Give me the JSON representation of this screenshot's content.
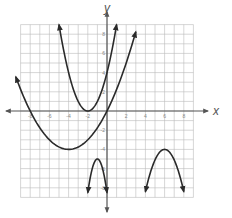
{
  "chart_data": {
    "type": "line",
    "title": "",
    "xlabel": "x",
    "ylabel": "y",
    "xlim": [
      -9,
      9
    ],
    "ylim": [
      -9,
      9
    ],
    "grid": true,
    "x_ticks": [
      -8,
      -6,
      -4,
      -2,
      2,
      4,
      6,
      8
    ],
    "y_ticks": [
      8,
      6,
      4,
      2,
      -2,
      -4,
      -6,
      -8
    ],
    "x_tick_labels": [
      "-8",
      "-6",
      "-4",
      "-2",
      "2",
      "4",
      "6",
      "8"
    ],
    "y_tick_labels": [
      "8",
      "6",
      "4",
      "2",
      "-2",
      "-4",
      "-6",
      "-8"
    ],
    "series": [
      {
        "name": "parabola-vertex-(-2,0)",
        "vertex": [
          -2,
          0
        ],
        "opens": "up",
        "equation": "y=(x+2)^2",
        "x_range": [
          -5,
          1
        ],
        "a": 1,
        "h": -2,
        "k": 0
      },
      {
        "name": "parabola-vertex-(-4,-4)",
        "vertex": [
          -4,
          -4
        ],
        "opens": "up",
        "equation": "y=0.25(x+4)^2-4",
        "x_range": [
          -9.5,
          3
        ],
        "a": 0.25,
        "h": -4,
        "k": -4
      },
      {
        "name": "parabola-vertex-(-1,-5)",
        "vertex": [
          -1,
          -5
        ],
        "opens": "down",
        "equation": "y=-3.5(x+1)^2-5",
        "x_range": [
          -2,
          0
        ],
        "a": -3.5,
        "h": -1,
        "k": -5
      },
      {
        "name": "parabola-vertex-(6,-4)",
        "vertex": [
          6,
          -4
        ],
        "opens": "down",
        "equation": "y=-1.1(x-6)^2-4",
        "x_range": [
          4,
          8
        ],
        "a": -1.1,
        "h": 6,
        "k": -4
      }
    ]
  },
  "colors": {
    "grid": "#bbbbbb",
    "axis": "#555555",
    "curve": "#2a2a2a"
  }
}
